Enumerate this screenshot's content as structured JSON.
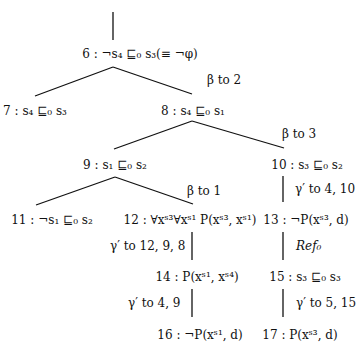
{
  "diagram": {
    "type": "tableau-proof-tree",
    "nodes": [
      {
        "id": "6",
        "label": "6 : ¬s₄ ⊑₀ s₃(≡ ¬φ)",
        "x": 140,
        "y": 54
      },
      {
        "id": "7",
        "label": "7 : s₄ ⊑₀ s₃",
        "x": 35,
        "y": 111
      },
      {
        "id": "8",
        "label": "8 : s₄ ⊑₀ s₁",
        "x": 193,
        "y": 111
      },
      {
        "id": "9",
        "label": "9 : s₁ ⊑₀ s₂",
        "x": 115,
        "y": 165
      },
      {
        "id": "10",
        "label": "10 : s₃ ⊑₀ s₂",
        "x": 307,
        "y": 165
      },
      {
        "id": "11",
        "label": "11 : ¬s₁ ⊑₀ s₂",
        "x": 52,
        "y": 220
      },
      {
        "id": "12",
        "label": "12 : ∀xˢ³∀xˢ¹ P(xˢ³, xˢ¹)",
        "x": 190,
        "y": 220
      },
      {
        "id": "13",
        "label": "13 : ¬P(xˢ³, d)",
        "x": 306,
        "y": 220
      },
      {
        "id": "14",
        "label": "14 : P(xˢ¹, xˢ⁴)",
        "x": 197,
        "y": 277
      },
      {
        "id": "15",
        "label": "15 : s₃ ⊑₀ s₃",
        "x": 305,
        "y": 277
      },
      {
        "id": "16",
        "label": "16 : ¬P(xˢ¹, d)",
        "x": 200,
        "y": 335
      },
      {
        "id": "17",
        "label": "17 : P(xˢ³, d)",
        "x": 300,
        "y": 335
      }
    ],
    "rules": [
      {
        "id": "r1",
        "label": "β to 2",
        "x": 207,
        "y": 80
      },
      {
        "id": "r2",
        "label": "β to 3",
        "x": 282,
        "y": 134
      },
      {
        "id": "r3",
        "label": "β to 1",
        "x": 187,
        "y": 191
      },
      {
        "id": "r4",
        "label": "γ′ to 4, 10",
        "x": 295,
        "y": 189
      },
      {
        "id": "r5",
        "label": "γ′ to 12, 9, 8",
        "x": 110,
        "y": 246
      },
      {
        "id": "r6",
        "label": "Ref₀",
        "x": 296,
        "y": 246
      },
      {
        "id": "r7",
        "label": "γ′ to 4, 9",
        "x": 128,
        "y": 303
      },
      {
        "id": "r8",
        "label": "γ′ to 5, 15",
        "x": 296,
        "y": 303
      }
    ],
    "edges": [
      {
        "from": [
          113,
          12
        ],
        "to": [
          113,
          40
        ]
      },
      {
        "from": [
          113,
          67
        ],
        "to": [
          35,
          96
        ]
      },
      {
        "from": [
          113,
          67
        ],
        "to": [
          192,
          94
        ]
      },
      {
        "from": [
          192,
          121
        ],
        "to": [
          114,
          149
        ]
      },
      {
        "from": [
          192,
          121
        ],
        "to": [
          284,
          148
        ]
      },
      {
        "from": [
          115,
          177
        ],
        "to": [
          36,
          205
        ]
      },
      {
        "from": [
          115,
          177
        ],
        "to": [
          193,
          204
        ]
      },
      {
        "from": [
          283,
          176
        ],
        "to": [
          283,
          202
        ]
      },
      {
        "from": [
          192,
          232
        ],
        "to": [
          192,
          260
        ]
      },
      {
        "from": [
          192,
          289
        ],
        "to": [
          192,
          317
        ]
      },
      {
        "from": [
          283,
          232
        ],
        "to": [
          283,
          260
        ]
      },
      {
        "from": [
          283,
          289
        ],
        "to": [
          283,
          317
        ]
      }
    ]
  }
}
